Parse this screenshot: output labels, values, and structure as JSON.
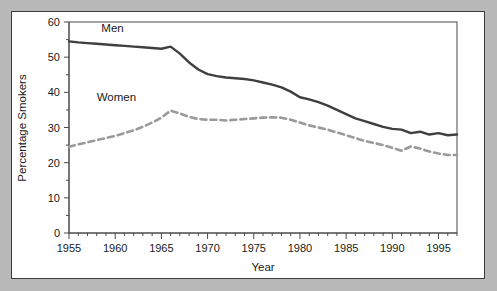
{
  "figure": {
    "background_band_color": "#b9b9b9",
    "sheet_color": "#ffffff",
    "sheet_border_color": "#3c3c3c"
  },
  "chart_data": {
    "type": "line",
    "title": "",
    "xlabel": "Year",
    "ylabel": "Percentage Smokers",
    "xlim": [
      1955,
      1997
    ],
    "ylim": [
      0,
      60
    ],
    "grid": false,
    "legend_position": "inline-labels",
    "y_ticks": [
      0,
      10,
      20,
      30,
      40,
      50,
      60
    ],
    "y_tick_labels": [
      "0",
      "10",
      "20",
      "30",
      "40",
      "50",
      "60"
    ],
    "x_ticks": [
      1955,
      1960,
      1965,
      1970,
      1975,
      1980,
      1985,
      1990,
      1995
    ],
    "x_tick_labels": [
      "1955",
      "1960",
      "1965",
      "1970",
      "1975",
      "1980",
      "1985",
      "1990",
      "1995"
    ],
    "x_minor_tick_interval": 1,
    "x": [
      1955,
      1956,
      1957,
      1958,
      1959,
      1960,
      1961,
      1962,
      1963,
      1964,
      1965,
      1966,
      1967,
      1968,
      1969,
      1970,
      1971,
      1972,
      1973,
      1974,
      1975,
      1976,
      1977,
      1978,
      1979,
      1980,
      1981,
      1982,
      1983,
      1984,
      1985,
      1986,
      1987,
      1988,
      1989,
      1990,
      1991,
      1992,
      1993,
      1994,
      1995,
      1996,
      1997
    ],
    "series": [
      {
        "name": "Men",
        "label": "Men",
        "color": "#3f3f3f",
        "linestyle": "solid",
        "linewidth": 2.4,
        "values": [
          54.5,
          54.2,
          54.0,
          53.8,
          53.6,
          53.4,
          53.2,
          53.0,
          52.8,
          52.6,
          52.4,
          53.0,
          51.0,
          48.5,
          46.5,
          45.2,
          44.6,
          44.2,
          44.0,
          43.8,
          43.4,
          42.8,
          42.2,
          41.4,
          40.2,
          38.6,
          38.0,
          37.2,
          36.2,
          35.0,
          33.8,
          32.6,
          31.8,
          31.0,
          30.2,
          29.6,
          29.4,
          28.4,
          28.8,
          28.0,
          28.4,
          27.8,
          28.0
        ]
      },
      {
        "name": "Women",
        "label": "Women",
        "color": "#9a9a9a",
        "linestyle": "dashed",
        "linewidth": 2.6,
        "values": [
          24.5,
          25.2,
          25.8,
          26.4,
          27.0,
          27.6,
          28.4,
          29.2,
          30.2,
          31.4,
          32.8,
          34.8,
          34.0,
          33.0,
          32.4,
          32.2,
          32.2,
          32.0,
          32.2,
          32.4,
          32.6,
          32.8,
          32.9,
          32.8,
          32.2,
          31.4,
          30.6,
          30.0,
          29.4,
          28.6,
          27.8,
          27.0,
          26.2,
          25.6,
          25.0,
          24.2,
          23.4,
          24.6,
          24.0,
          23.2,
          22.6,
          22.2,
          22.2
        ]
      }
    ],
    "annotations": [
      {
        "text": "Men",
        "x": 1958.5,
        "y": 57.2
      },
      {
        "text": "Women",
        "x": 1958.0,
        "y": 37.4
      }
    ]
  }
}
